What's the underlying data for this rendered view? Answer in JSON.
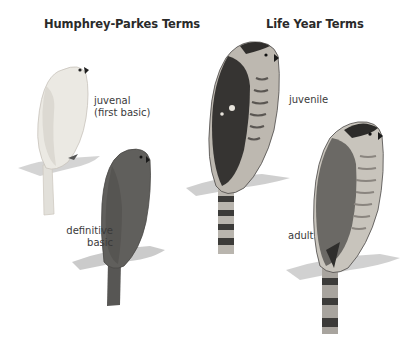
{
  "headings": {
    "left": "Humphrey-Parkes Terms",
    "right": "Life Year Terms"
  },
  "labels": {
    "juvenal_line1": "juvenal",
    "juvenal_line2": "(first basic)",
    "definitive_line1": "definitive",
    "definitive_line2": "basic",
    "juvenile": "juvenile",
    "adult": "adult"
  },
  "colors": {
    "juvenal_bird": "#e9e7e1",
    "definitive_bird": "#5f5e5b",
    "juvenile_back": "#3a3836",
    "juvenile_breast": "#bdb8b0",
    "adult_back": "#6c6a66",
    "adult_cap": "#2c2b29",
    "perch": "#cfcfcf",
    "tail_band": "#3c3b39"
  }
}
